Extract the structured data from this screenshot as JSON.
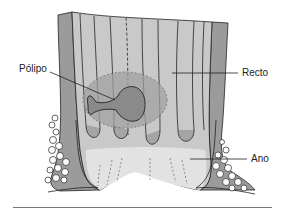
{
  "diagram": {
    "labels": [
      {
        "id": "polyp",
        "text": "Pólipo"
      },
      {
        "id": "rectum",
        "text": "Recto"
      },
      {
        "id": "anus",
        "text": "Ano"
      }
    ],
    "colors": {
      "wall_dark": "#8a8a8a",
      "wall_mid": "#a8a8a8",
      "lumen": "#d9d9d9",
      "lumen_light": "#e6e6e6",
      "polyp_region": "#9a9a9a",
      "polyp": "#858585",
      "outline": "#222222",
      "rule": "#777777"
    }
  }
}
